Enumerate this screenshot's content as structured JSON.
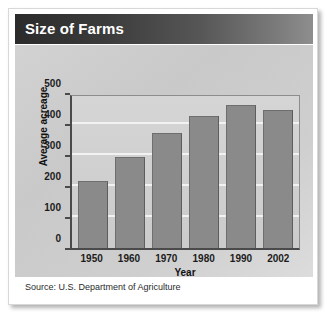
{
  "card": {
    "title": "Size of Farms",
    "source": "Source: U.S. Department of Agriculture"
  },
  "colors": {
    "header_dark": "#2b2b2b",
    "header_light": "#8e8e8e",
    "bar_fill": "#8a8a8a",
    "bar_stroke": "#6e6e6e",
    "panel_bg": "#cfcfcf",
    "gridline": "#f2f2f2",
    "axis": "#4a4a4a",
    "title_text": "#ffffff",
    "body_text": "#1c1c1c"
  },
  "chart_data": {
    "type": "bar",
    "title": "Size of Farms",
    "categories": [
      "1950",
      "1960",
      "1970",
      "1980",
      "1990",
      "2002"
    ],
    "values": [
      216,
      295,
      370,
      426,
      460,
      444
    ],
    "xlabel": "Year",
    "ylabel": "Average acreage",
    "ylim": [
      0,
      500
    ],
    "yticks": [
      0,
      100,
      200,
      300,
      400,
      500
    ],
    "ytick_labels": [
      "0",
      "100",
      "200",
      "300",
      "400",
      "500"
    ],
    "grid": true,
    "legend": null,
    "source": "Source: U.S. Department of Agriculture"
  }
}
